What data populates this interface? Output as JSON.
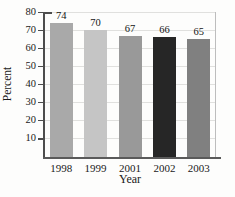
{
  "chart_data": {
    "type": "bar",
    "title": "",
    "xlabel": "Year",
    "ylabel": "Percent",
    "categories": [
      "1998",
      "1999",
      "2001",
      "2002",
      "2003"
    ],
    "values": [
      74,
      70,
      67,
      66,
      65
    ],
    "bar_colors": [
      "#a9a9a9",
      "#c5c5c5",
      "#999999",
      "#262626",
      "#808080"
    ],
    "ylim": [
      0,
      80
    ],
    "yticks": [
      10,
      20,
      30,
      40,
      50,
      60,
      70,
      80
    ],
    "grid": "horizontal",
    "legend": "none"
  },
  "style_colors": {
    "axis": "#4d4d4d",
    "gridline": "#e0e0de",
    "text": "#1a1a1a",
    "background": "#fdfdfc"
  }
}
